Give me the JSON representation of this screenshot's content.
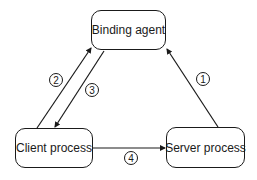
{
  "diagram": {
    "nodes": [
      {
        "id": "binding",
        "label": "Binding agent"
      },
      {
        "id": "client",
        "label": "Client process"
      },
      {
        "id": "server",
        "label": "Server process"
      }
    ],
    "edges": [
      {
        "step": "1",
        "from": "Server process",
        "to": "Binding agent"
      },
      {
        "step": "2",
        "from": "Client process",
        "to": "Binding agent"
      },
      {
        "step": "3",
        "from": "Binding agent",
        "to": "Client process"
      },
      {
        "step": "4",
        "from": "Client process",
        "to": "Server process"
      }
    ],
    "colors": {
      "stroke": "#1a1a1a",
      "background": "#ffffff"
    }
  }
}
